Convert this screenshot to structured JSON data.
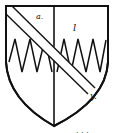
{
  "diagram": {
    "type": "heraldic-shield",
    "labels": {
      "top_left": "a.",
      "top_right": "l",
      "bend_end": "y."
    },
    "footer_marks": ". . ."
  },
  "colors": {
    "ink": "#111111",
    "background": "#ffffff"
  }
}
